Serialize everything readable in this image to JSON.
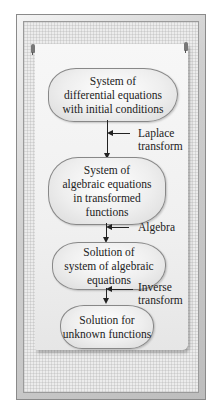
{
  "diagram": {
    "type": "flowchart",
    "nodes": [
      {
        "id": "n1",
        "lines": [
          "System of",
          "differential equations",
          "with initial conditions"
        ]
      },
      {
        "id": "n2",
        "lines": [
          "System of",
          "algebraic equations",
          "in transformed",
          "functions"
        ]
      },
      {
        "id": "n3",
        "lines": [
          "Solution of",
          "system of algebraic",
          "equations"
        ]
      },
      {
        "id": "n4",
        "lines": [
          "Solution for",
          "unknown functions"
        ]
      }
    ],
    "edges": [
      {
        "from": "n1",
        "to": "n2",
        "label_lines": [
          "Laplace",
          "transform"
        ]
      },
      {
        "from": "n2",
        "to": "n3",
        "label_lines": [
          "Algebra"
        ]
      },
      {
        "from": "n3",
        "to": "n4",
        "label_lines": [
          "Inverse",
          "transform"
        ]
      }
    ]
  },
  "colors": {
    "frame": "#cfcfcf",
    "paper": "#f2f2f2",
    "cloud_fill": "#eeeeee",
    "stroke": "#222222"
  }
}
